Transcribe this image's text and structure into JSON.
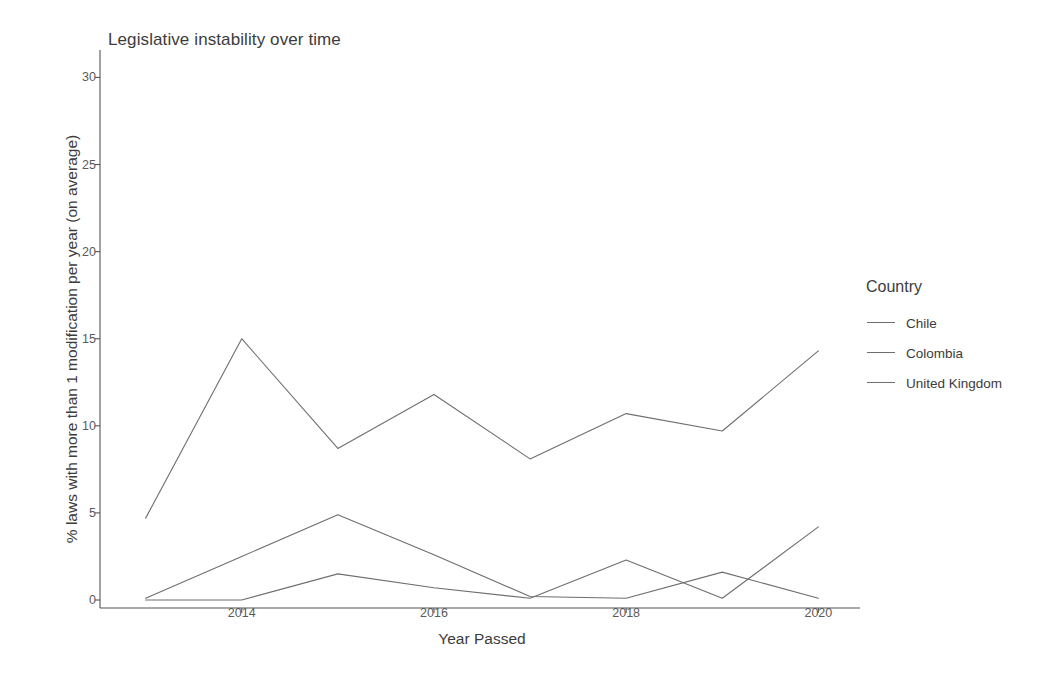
{
  "chart_data": {
    "type": "line",
    "title": "Legislative instability over time",
    "xlabel": "Year Passed",
    "ylabel": "% laws with more than 1 modification per year (on average)",
    "x": [
      2013,
      2014,
      2015,
      2016,
      2017,
      2018,
      2019,
      2020
    ],
    "xticks": [
      "2014",
      "2016",
      "2018",
      "2020"
    ],
    "xtick_values": [
      2014,
      2016,
      2018,
      2020
    ],
    "yticks": [
      "0",
      "5",
      "10",
      "15",
      "20",
      "25",
      "30"
    ],
    "ytick_values": [
      0,
      5,
      10,
      15,
      20,
      25,
      30
    ],
    "xlim": [
      2012.65,
      2020.35
    ],
    "ylim": [
      0,
      31
    ],
    "grid": false,
    "legend_position": "right",
    "legend_title": "Country",
    "series": [
      {
        "name": "Chile",
        "color": "#6e6e6e",
        "values": [
          4.7,
          15.0,
          8.7,
          11.8,
          8.1,
          10.7,
          9.7,
          14.3
        ]
      },
      {
        "name": "Colombia",
        "color": "#6e6e6e",
        "values": [
          0.1,
          2.5,
          4.9,
          2.6,
          0.2,
          0.1,
          1.6,
          0.1
        ]
      },
      {
        "name": "United Kingdom",
        "color": "#6e6e6e",
        "values": [
          0.0,
          0.0,
          1.5,
          0.7,
          0.1,
          2.3,
          0.1,
          4.2
        ]
      }
    ]
  },
  "legend": {
    "title": "Country",
    "items": [
      {
        "label": "Chile"
      },
      {
        "label": "Colombia"
      },
      {
        "label": "United Kingdom"
      }
    ]
  },
  "axis": {
    "panel_color": "#ffffff",
    "axis_line_color": "#555555"
  }
}
